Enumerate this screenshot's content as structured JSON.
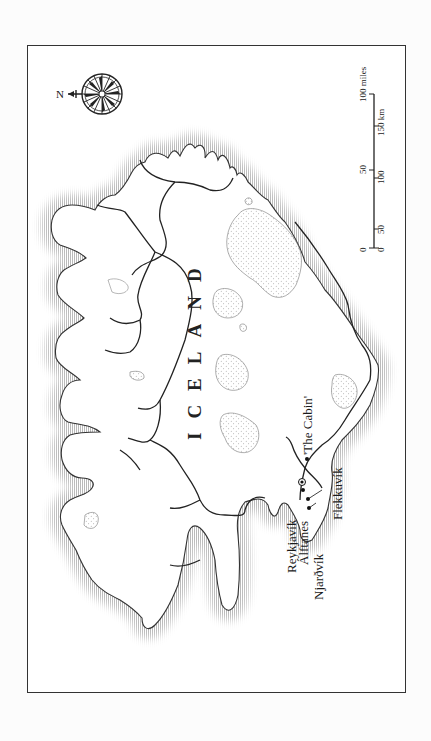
{
  "map": {
    "country_label": "ICELAND",
    "compass": {
      "north_label": "N",
      "orientation": "north-left"
    },
    "places": [
      {
        "name": "Reykjavík",
        "type": "capital",
        "marker": "circled-dot"
      },
      {
        "name": "Álftanes",
        "type": "town",
        "marker": "dot"
      },
      {
        "name": "Njarðvík",
        "type": "town",
        "marker": "dot"
      },
      {
        "name": "'The Cabin'",
        "type": "site",
        "marker": "dot"
      },
      {
        "name": "Flekkuvík",
        "type": "site",
        "marker": "dot"
      }
    ],
    "scale_bar": {
      "miles": {
        "ticks": [
          "0",
          "50",
          "100 miles"
        ]
      },
      "km": {
        "ticks": [
          "0",
          "50",
          "100",
          "150 km"
        ]
      }
    },
    "colors": {
      "frame": "#333333",
      "coast": "#222222",
      "hatch": "#9a9a9a",
      "glacier_stipple": "#888888",
      "background": "#ffffff"
    }
  }
}
